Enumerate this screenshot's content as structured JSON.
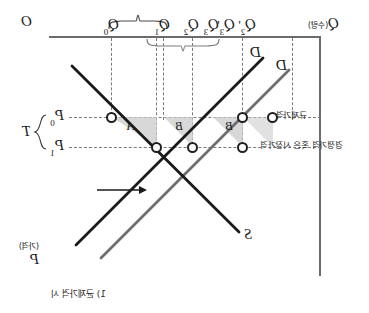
{
  "figure": {
    "caption": "1) 균제가격 시",
    "mirrored": true,
    "axes": {
      "origin_label": "O",
      "x_axis": {
        "symbol": "Q",
        "unit_note": "(수량)",
        "position": "top"
      },
      "y_axis": {
        "symbol": "P",
        "unit_note": "(가격)",
        "position": "right"
      }
    },
    "curves": [
      {
        "name": "demand_outer",
        "label": "D",
        "color": "#1a1a1a"
      },
      {
        "name": "demand_inner",
        "label": "D",
        "color": "#6e6e6e"
      },
      {
        "name": "supply",
        "label": "S",
        "color": "#1a1a1a"
      }
    ],
    "price_levels": [
      {
        "id": "p0",
        "label": "P",
        "sub": "0",
        "note": "규제가격"
      },
      {
        "id": "p1",
        "label": "P",
        "sub": "1",
        "note": "경쟁가격 혹은 시장가격"
      }
    ],
    "price_gap_brace_label": "T",
    "quantity_ticks": [
      {
        "id": "q0",
        "label": "Q",
        "sub": "0",
        "prime": ""
      },
      {
        "id": "q1",
        "label": "Q",
        "sub": "1",
        "prime": ""
      },
      {
        "id": "q2",
        "label": "Q",
        "sub": "2",
        "prime": ""
      },
      {
        "id": "q3",
        "label": "Q",
        "sub": "3",
        "prime": ""
      },
      {
        "id": "q3p",
        "label": "Q",
        "sub": "3",
        "prime": "'"
      },
      {
        "id": "q2p",
        "label": "Q",
        "sub": "2",
        "prime": "'"
      }
    ],
    "regions": [
      {
        "id": "region-a",
        "label": "A"
      },
      {
        "id": "region-b1",
        "label": "B"
      },
      {
        "id": "region-b2",
        "label": "B"
      }
    ],
    "annotations": {
      "shift_arrow": "←",
      "brace_top": "",
      "brace_lower": ""
    }
  }
}
